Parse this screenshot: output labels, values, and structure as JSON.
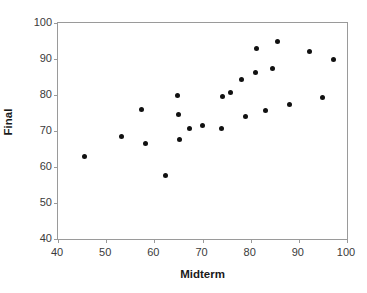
{
  "chart_data": {
    "type": "scatter",
    "title": "",
    "xlabel": "Midterm",
    "ylabel": "Final",
    "xlim": [
      40,
      100
    ],
    "ylim": [
      40,
      100
    ],
    "xticks": [
      40,
      50,
      60,
      70,
      80,
      90,
      100
    ],
    "yticks": [
      40,
      50,
      60,
      70,
      80,
      90,
      100
    ],
    "grid": false,
    "legend": null,
    "marker": {
      "shape": "circle",
      "color": "#111111",
      "size": 5
    },
    "frame_color": "#9a9a9a",
    "series": [
      {
        "name": "students",
        "points": [
          [
            45.4,
            63.0
          ],
          [
            53.1,
            68.6
          ],
          [
            57.4,
            75.9
          ],
          [
            58.1,
            66.6
          ],
          [
            62.3,
            57.7
          ],
          [
            64.9,
            79.8
          ],
          [
            65.0,
            74.5
          ],
          [
            65.2,
            67.7
          ],
          [
            67.2,
            70.7
          ],
          [
            70.1,
            71.4
          ],
          [
            73.9,
            70.6
          ],
          [
            74.2,
            79.7
          ],
          [
            75.9,
            80.6
          ],
          [
            78.0,
            84.2
          ],
          [
            79.0,
            73.9
          ],
          [
            81.0,
            86.3
          ],
          [
            81.2,
            92.9
          ],
          [
            83.0,
            75.7
          ],
          [
            84.5,
            87.5
          ],
          [
            85.5,
            95.0
          ],
          [
            88.0,
            77.4
          ],
          [
            92.2,
            92.2
          ],
          [
            95.0,
            79.3
          ],
          [
            97.2,
            90.0
          ]
        ]
      }
    ]
  }
}
